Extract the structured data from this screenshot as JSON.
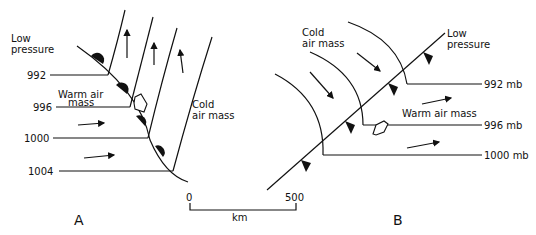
{
  "panel_a": {
    "letter": "A",
    "title": "Warm front",
    "low_pressure": [
      "Low",
      "pressure"
    ],
    "warm_air_mass": [
      "Warm air",
      "mass"
    ],
    "cold_air_mass": [
      "Cold",
      "air mass"
    ],
    "isobars": [
      "992",
      "996",
      "1000",
      "1004"
    ]
  },
  "panel_b": {
    "letter": "B",
    "title": "Cold front",
    "low_pressure": [
      "Low",
      "pressure"
    ],
    "cold_air_mass": [
      "Cold",
      "air mass"
    ],
    "warm_air_mass": "Warm air mass",
    "isobars": [
      "992 mb",
      "996 mb",
      "1000 mb"
    ]
  },
  "scale": {
    "start": "0",
    "end": "500",
    "unit": "km"
  }
}
